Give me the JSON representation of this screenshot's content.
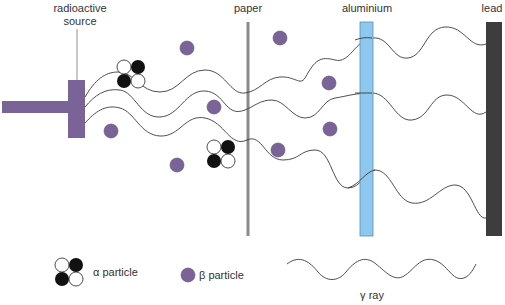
{
  "labels": {
    "source_line1": "radioactive",
    "source_line2": "source",
    "paper": "paper",
    "aluminium": "aluminium",
    "lead": "lead"
  },
  "legend": {
    "alpha": "α particle",
    "beta": "β particle",
    "gamma": "γ ray"
  },
  "colors": {
    "source": "#7a6497",
    "beta": "#7a6497",
    "paper": "#8a8a8a",
    "aluminium": "#8ec8ee",
    "aluminium_border": "#5a8fb0",
    "lead": "#3d3d3d",
    "wave": "#3a3a3a"
  }
}
